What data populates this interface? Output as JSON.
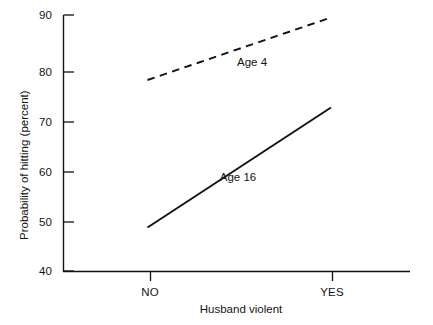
{
  "chart_data": {
    "type": "line",
    "title": "",
    "subtitle": "",
    "xlabel": "Husband violent",
    "ylabel": "Probability of hitting (percent)",
    "categories": [
      "NO",
      "YES"
    ],
    "xtick_labels": [
      "NO",
      "YES"
    ],
    "ytick_labels": [
      "40",
      "50",
      "60",
      "70",
      "80",
      "90"
    ],
    "yticks": [
      40,
      50,
      60,
      70,
      80,
      90
    ],
    "ylim": [
      40,
      90
    ],
    "grid": false,
    "legend_position": "inline-annotations",
    "series": [
      {
        "name": "Age 4",
        "style": "dashed",
        "color": "#111111",
        "values": [
          77,
          89.5
        ],
        "label": "Age 4",
        "label_x": "YES-side-midpoint",
        "label_value": 81.5
      },
      {
        "name": "Age 16",
        "style": "solid",
        "color": "#111111",
        "values": [
          47.5,
          71.5
        ],
        "label": "Age 16",
        "label_value": 62
      }
    ],
    "annotations": [
      {
        "text": "Age 4",
        "series": "Age 4"
      },
      {
        "text": "Age 16",
        "series": "Age 16"
      }
    ]
  },
  "axes": {
    "y_title": "Probability of hitting (percent)",
    "x_title": "Husband violent",
    "y_ticks": [
      {
        "label": "90",
        "value": 90
      },
      {
        "label": "80",
        "value": 80
      },
      {
        "label": "70",
        "value": 70
      },
      {
        "label": "60",
        "value": 60
      },
      {
        "label": "50",
        "value": 50
      },
      {
        "label": "40",
        "value": 40
      }
    ],
    "x_ticks": [
      {
        "label": "NO",
        "value": 0
      },
      {
        "label": "YES",
        "value": 1
      }
    ]
  },
  "colors": {
    "axis": "#111111",
    "text": "#141414",
    "line": "#111111",
    "background": "#ffffff"
  }
}
